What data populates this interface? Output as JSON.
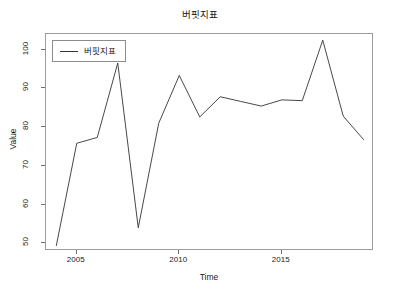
{
  "chart_data": {
    "type": "line",
    "title": "버핏지표",
    "xlabel": "Time",
    "ylabel": "Value",
    "grid": false,
    "legend_position": "top-left",
    "xlim": [
      2003.5,
      2019.5
    ],
    "ylim": [
      48.0,
      104.0
    ],
    "xticks": [
      2005,
      2010,
      2015
    ],
    "xtick_labels": [
      "2005",
      "2010",
      "2015"
    ],
    "yticks": [
      50,
      60,
      70,
      80,
      90,
      100
    ],
    "ytick_labels": [
      "50",
      "60",
      "70",
      "80",
      "90",
      "100"
    ],
    "x": [
      2004,
      2005,
      2006,
      2007,
      2008,
      2009,
      2010,
      2011,
      2012,
      2013,
      2014,
      2015,
      2016,
      2017,
      2018,
      2019
    ],
    "series": [
      {
        "name": "버핏지표",
        "color": "#333333",
        "values": [
          49.3,
          75.8,
          77.3,
          96.5,
          54.0,
          81.0,
          93.3,
          82.6,
          87.8,
          86.6,
          85.4,
          87.0,
          86.8,
          102.4,
          82.8,
          76.7
        ]
      }
    ]
  },
  "legend": {
    "entries": [
      {
        "label": "버핏지표",
        "marker": "line"
      }
    ]
  },
  "axes": {
    "x_title": "Time",
    "y_title": "Value"
  }
}
